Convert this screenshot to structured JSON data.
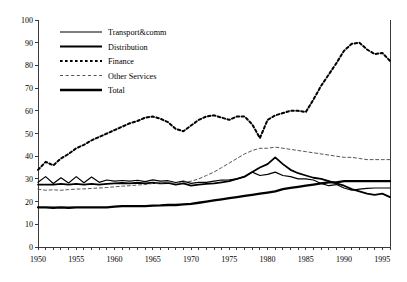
{
  "chart_data": {
    "type": "line",
    "title": "",
    "subtitle": "",
    "xlabel": "",
    "ylabel": "",
    "xlim": [
      1950,
      1996
    ],
    "ylim": [
      0,
      100
    ],
    "ytick_step": 10,
    "xtick_step": 1,
    "xlabel_step": 5,
    "grid": false,
    "legend_position": "top-left",
    "yticks": [
      0,
      10,
      20,
      30,
      40,
      50,
      60,
      70,
      80,
      90,
      100
    ],
    "ytick_labels": [
      "0",
      "10",
      "20",
      "30",
      "40",
      "50",
      "60",
      "70",
      "80",
      "90",
      "100"
    ],
    "xticks": [
      1950,
      1951,
      1952,
      1953,
      1954,
      1955,
      1956,
      1957,
      1958,
      1959,
      1960,
      1961,
      1962,
      1963,
      1964,
      1965,
      1966,
      1967,
      1968,
      1969,
      1970,
      1971,
      1972,
      1973,
      1974,
      1975,
      1976,
      1977,
      1978,
      1979,
      1980,
      1981,
      1982,
      1983,
      1984,
      1985,
      1986,
      1987,
      1988,
      1989,
      1990,
      1991,
      1992,
      1993,
      1994,
      1995,
      1996
    ],
    "xtick_labels": [
      "1950",
      "1955",
      "1960",
      "1965",
      "1970",
      "1975",
      "1980",
      "1985",
      "1990",
      "1995"
    ],
    "xtick_label_values": [
      1950,
      1955,
      1960,
      1965,
      1970,
      1975,
      1980,
      1985,
      1990,
      1995
    ],
    "x": [
      1950,
      1951,
      1952,
      1953,
      1954,
      1955,
      1956,
      1957,
      1958,
      1959,
      1960,
      1961,
      1962,
      1963,
      1964,
      1965,
      1966,
      1967,
      1968,
      1969,
      1970,
      1971,
      1972,
      1973,
      1974,
      1975,
      1976,
      1977,
      1978,
      1979,
      1980,
      1981,
      1982,
      1983,
      1984,
      1985,
      1986,
      1987,
      1988,
      1989,
      1990,
      1991,
      1992,
      1993,
      1994,
      1995,
      1996
    ],
    "series": [
      {
        "name": "Transport&comm",
        "style": "solid-thin",
        "color": "#000000",
        "width": 1.2,
        "values": [
          28.5,
          31.0,
          28.0,
          30.5,
          28.2,
          31.0,
          28.3,
          30.8,
          28.5,
          29.5,
          29.0,
          29.3,
          29.0,
          29.4,
          28.8,
          29.6,
          29.0,
          29.2,
          28.4,
          29.0,
          28.0,
          28.5,
          28.5,
          29.0,
          29.5,
          29.6,
          30.0,
          31.0,
          33.0,
          31.5,
          32.0,
          33.0,
          31.5,
          31.0,
          30.0,
          30.0,
          29.5,
          28.0,
          27.0,
          27.5,
          26.0,
          25.0,
          25.5,
          25.8,
          26.0,
          26.0,
          26.0
        ]
      },
      {
        "name": "Distribution",
        "style": "solid-medium",
        "color": "#000000",
        "width": 1.8,
        "values": [
          27.5,
          27.5,
          27.5,
          27.8,
          27.5,
          27.8,
          27.5,
          27.8,
          27.5,
          27.8,
          28.0,
          28.2,
          28.0,
          28.3,
          28.0,
          28.3,
          28.0,
          28.2,
          27.5,
          28.0,
          27.0,
          27.5,
          27.8,
          28.0,
          28.5,
          29.0,
          30.0,
          31.0,
          33.0,
          35.0,
          36.5,
          39.5,
          36.5,
          34.0,
          32.5,
          31.5,
          30.5,
          30.0,
          29.0,
          28.0,
          27.0,
          25.5,
          24.5,
          23.5,
          23.0,
          23.5,
          22.0
        ]
      },
      {
        "name": "Finance",
        "style": "dashed-bold",
        "color": "#000000",
        "width": 2.0,
        "values": [
          34.0,
          37.5,
          36.0,
          39.0,
          41.0,
          43.5,
          45.0,
          47.0,
          48.5,
          50.0,
          51.5,
          53.0,
          54.5,
          55.5,
          57.0,
          57.5,
          56.5,
          55.0,
          52.0,
          51.0,
          53.5,
          56.0,
          57.5,
          58.0,
          57.0,
          56.0,
          57.5,
          57.5,
          54.0,
          48.0,
          56.0,
          58.0,
          59.0,
          60.0,
          60.0,
          59.5,
          65.0,
          71.0,
          76.0,
          81.0,
          86.5,
          89.5,
          90.0,
          87.0,
          85.0,
          85.5,
          82.0
        ]
      },
      {
        "name": "Other Services",
        "style": "dashed-thin",
        "color": "#555555",
        "width": 1.0,
        "values": [
          25.5,
          25.0,
          25.2,
          25.0,
          25.3,
          25.5,
          25.6,
          25.8,
          26.0,
          26.2,
          26.5,
          26.8,
          27.0,
          27.3,
          27.5,
          28.0,
          28.2,
          28.5,
          28.0,
          28.5,
          29.0,
          30.0,
          31.5,
          33.0,
          35.0,
          37.0,
          39.0,
          41.0,
          42.5,
          43.5,
          43.5,
          44.0,
          43.5,
          43.0,
          42.5,
          42.0,
          41.5,
          41.0,
          40.5,
          40.0,
          39.5,
          39.5,
          39.0,
          38.5,
          38.5,
          38.5,
          38.5
        ]
      },
      {
        "name": "Total",
        "style": "solid-bold",
        "color": "#000000",
        "width": 2.3,
        "values": [
          17.5,
          17.5,
          17.3,
          17.5,
          17.3,
          17.5,
          17.5,
          17.5,
          17.5,
          17.5,
          17.8,
          18.0,
          18.0,
          18.0,
          18.0,
          18.2,
          18.3,
          18.5,
          18.5,
          18.8,
          19.0,
          19.5,
          20.0,
          20.5,
          21.0,
          21.5,
          22.0,
          22.5,
          23.0,
          23.5,
          24.0,
          24.5,
          25.5,
          26.0,
          26.5,
          27.0,
          27.5,
          28.0,
          28.5,
          28.5,
          29.0,
          29.0,
          29.0,
          29.0,
          29.0,
          29.0,
          29.0
        ]
      }
    ]
  },
  "legend": {
    "entries": [
      {
        "label": "Transport&comm",
        "style": "solid-thin"
      },
      {
        "label": "Distribution",
        "style": "solid-medium"
      },
      {
        "label": "Finance",
        "style": "dashed-bold"
      },
      {
        "label": "Other Services",
        "style": "dashed-thin"
      },
      {
        "label": "Total",
        "style": "solid-bold"
      }
    ]
  }
}
